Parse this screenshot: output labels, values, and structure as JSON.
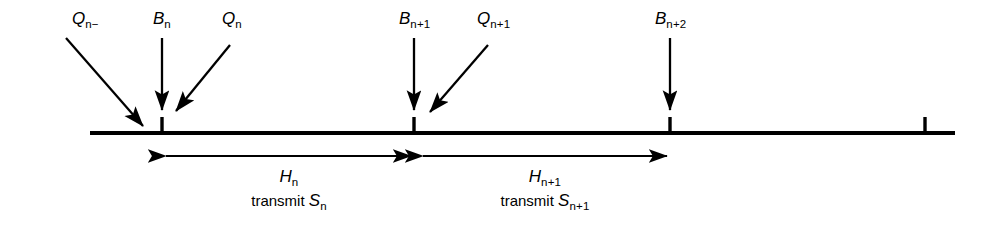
{
  "figure": {
    "type": "timing-diagram",
    "background_color": "#ffffff",
    "stroke_color": "#000000",
    "timeline": {
      "x_start": 90,
      "x_end": 955,
      "y": 133,
      "thickness": 4
    },
    "ticks": [
      {
        "name": "tick-bn",
        "x": 162,
        "label": "B_n",
        "labeled": true
      },
      {
        "name": "tick-bn1",
        "x": 414,
        "label": "B_{n+1}",
        "labeled": true
      },
      {
        "name": "tick-bn2",
        "x": 670,
        "label": "B_{n+2}",
        "labeled": true
      },
      {
        "name": "tick-unlabeled",
        "x": 925,
        "label": "",
        "labeled": false
      }
    ],
    "top_labels": [
      {
        "name": "label-q-n-minus",
        "base": "Q",
        "sub": "n−",
        "x": 75,
        "y": 10
      },
      {
        "name": "label-b-n",
        "base": "B",
        "sub": "n",
        "x": 156,
        "y": 10
      },
      {
        "name": "label-q-n",
        "base": "Q",
        "sub": "n",
        "x": 225,
        "y": 10
      },
      {
        "name": "label-b-n-plus-1",
        "base": "B",
        "sub": "n+1",
        "x": 402,
        "y": 10
      },
      {
        "name": "label-q-n-plus-1",
        "base": "Q",
        "sub": "n+1",
        "x": 480,
        "y": 10
      },
      {
        "name": "label-b-n-plus-2",
        "base": "B",
        "sub": "n+2",
        "x": 658,
        "y": 10
      }
    ],
    "pointer_arrows": [
      {
        "name": "arrow-q-n-minus",
        "x1": 66,
        "y1": 38,
        "x2": 146,
        "y2": 128,
        "kind": "diagonal"
      },
      {
        "name": "arrow-b-n",
        "x1": 162,
        "y1": 38,
        "x2": 162,
        "y2": 112,
        "kind": "vertical"
      },
      {
        "name": "arrow-q-n",
        "x1": 229,
        "y1": 45,
        "x2": 175,
        "y2": 112,
        "kind": "diagonal"
      },
      {
        "name": "arrow-b-n-plus-1",
        "x1": 414,
        "y1": 38,
        "x2": 414,
        "y2": 112,
        "kind": "vertical"
      },
      {
        "name": "arrow-q-n-plus-1",
        "x1": 487,
        "y1": 45,
        "x2": 429,
        "y2": 113,
        "kind": "diagonal"
      },
      {
        "name": "arrow-b-n-plus-2",
        "x1": 670,
        "y1": 38,
        "x2": 670,
        "y2": 112,
        "kind": "vertical"
      }
    ],
    "intervals": [
      {
        "name": "interval-hn",
        "x_start": 163,
        "x_end": 414,
        "y": 156,
        "label_base": "H",
        "label_sub": "n",
        "caption_prefix": "transmit ",
        "caption_base": "S",
        "caption_sub": "n",
        "label_x": 289,
        "label_y": 170,
        "caption_x": 289,
        "caption_y": 192
      },
      {
        "name": "interval-hn1",
        "x_start": 420,
        "x_end": 670,
        "y": 156,
        "label_base": "H",
        "label_sub": "n+1",
        "caption_prefix": "transmit ",
        "caption_base": "S",
        "caption_sub": "n+1",
        "label_x": 545,
        "label_y": 170,
        "caption_x": 545,
        "caption_y": 192
      }
    ]
  }
}
